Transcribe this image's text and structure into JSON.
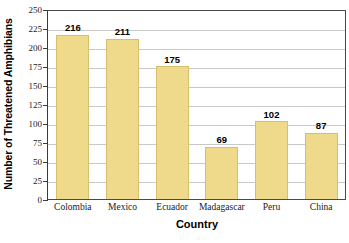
{
  "chart_data": {
    "type": "bar",
    "title": "",
    "xlabel": "Country",
    "ylabel": "Number of Threatened Amphibians",
    "categories": [
      "Colombia",
      "Mexico",
      "Ecuador",
      "Madagascar",
      "Peru",
      "China"
    ],
    "values": [
      216,
      211,
      175,
      69,
      102,
      87
    ],
    "value_labels": [
      "216",
      "211",
      "175",
      "69",
      "102",
      "87"
    ],
    "ylim": [
      0,
      250
    ],
    "ytick_values": [
      0,
      25,
      50,
      75,
      100,
      125,
      150,
      175,
      200,
      225,
      250
    ],
    "ytick_labels": [
      "0",
      "25",
      "50",
      "75",
      "100",
      "125",
      "150",
      "175",
      "200",
      "225",
      "250"
    ],
    "grid": true,
    "legend": "none",
    "bar_color": "#efd98a",
    "bar_border_color": "#d8bf70",
    "gridline_color": "#c9c9c9",
    "axis_color": "#4a4a4a",
    "background_color": "#ffffff"
  }
}
